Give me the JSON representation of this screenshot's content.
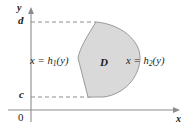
{
  "figure": {
    "axes": {
      "y_axis_label": "y",
      "x_axis_label": "x",
      "origin_label": "0",
      "y_tick_upper": "d",
      "y_tick_lower": "c"
    },
    "labels": {
      "left_boundary_prefix": "x = h",
      "left_boundary_subscript": "1",
      "left_boundary_suffix": "(y)",
      "right_boundary_prefix": "x = h",
      "right_boundary_subscript": "2",
      "right_boundary_suffix": "(y)",
      "region_label": "D"
    },
    "colors": {
      "region_fill": "#d9d9d9",
      "region_stroke": "#9a9a9a",
      "axis": "#8c8c8c",
      "dashed_guide": "#8c8c8c",
      "text": "#1a1a1a",
      "background": "#ffffff"
    }
  }
}
